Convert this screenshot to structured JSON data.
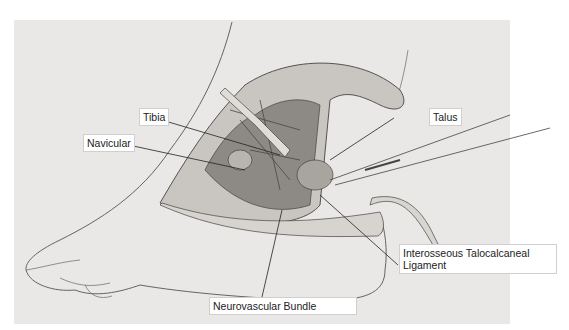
{
  "figure": {
    "type": "surgical anatomical illustration",
    "background_color": "#e9e8e6",
    "line_color": "#333333"
  },
  "labels": [
    {
      "id": "tibia",
      "text": "Tibia"
    },
    {
      "id": "navicular",
      "text": "Navicular"
    },
    {
      "id": "talus",
      "text": "Talus"
    },
    {
      "id": "interosseous",
      "line1": "Interosseous Talocalcaneal",
      "line2": "Ligament"
    },
    {
      "id": "neurovascular",
      "text": "Neurovascular Bundle"
    }
  ]
}
